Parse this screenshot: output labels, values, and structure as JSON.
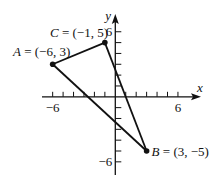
{
  "figure": {
    "type": "coordinate-plane-triangle",
    "axes": {
      "x_label": "x",
      "y_label": "y",
      "x_tick_labels": [
        {
          "value": -6,
          "text": "−6"
        },
        {
          "value": 6,
          "text": "6"
        }
      ],
      "y_tick_labels": [
        {
          "value": 6,
          "text": "6"
        },
        {
          "value": -6,
          "text": "−6"
        }
      ],
      "x_range": [
        -6,
        6
      ],
      "y_range": [
        -6,
        6
      ],
      "tick_step": 1
    },
    "points": [
      {
        "name": "A",
        "x": -6,
        "y": 3,
        "label": "A = (−6, 3)"
      },
      {
        "name": "B",
        "x": 3,
        "y": -5,
        "label": "B = (3, −5)"
      },
      {
        "name": "C",
        "x": -1,
        "y": 5,
        "label": "C = (−1, 5)"
      }
    ],
    "segments": [
      [
        "A",
        "C"
      ],
      [
        "C",
        "B"
      ],
      [
        "B",
        "A"
      ]
    ],
    "colors": {
      "stroke": "#111111",
      "background": "#ffffff"
    }
  }
}
